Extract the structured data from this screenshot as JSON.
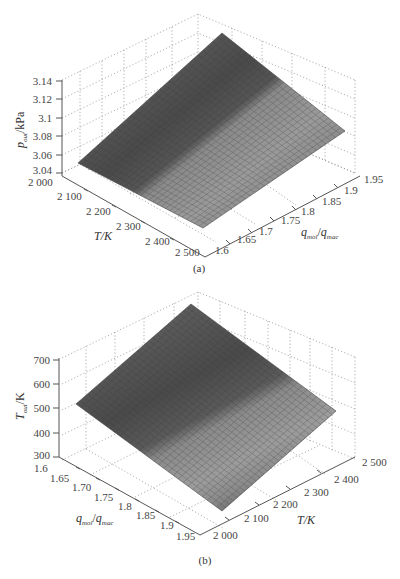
{
  "chart_data": [
    {
      "id": "a",
      "type": "surface3d",
      "caption": "(a)",
      "zlabel": "p_out/kPa",
      "zlabel_main": "p",
      "zlabel_sub": "out",
      "zlabel_unit": "/kPa",
      "xlabel": "T/K",
      "ylabel": "q_mol/q_mac",
      "zlim": [
        3.04,
        3.14
      ],
      "xlim": [
        2000,
        2500
      ],
      "ylim": [
        1.6,
        1.95
      ],
      "zticks": [
        "3.04",
        "3.06",
        "3.08",
        "3.1",
        "3.12",
        "3.14"
      ],
      "xticks": [
        "2 000",
        "2 100",
        "2 200",
        "2 300",
        "2 400",
        "2 500"
      ],
      "yticks": [
        "1.6",
        "1.65",
        "1.7",
        "1.75",
        "1.8",
        "1.85",
        "1.9",
        "1.95"
      ],
      "grid": true,
      "colormap": "gray",
      "surface_corners": {
        "T2000_q1.95": 3.1,
        "T2000_q1.6": 3.14,
        "T2500_q1.95": 3.05,
        "T2500_q1.6": 3.08
      }
    },
    {
      "id": "b",
      "type": "surface3d",
      "caption": "(b)",
      "zlabel": "T_out/K",
      "zlabel_main": "T",
      "zlabel_sub": "out",
      "zlabel_unit": "/K",
      "xlabel": "q_mol/q_mac",
      "ylabel": "T/K",
      "zlim": [
        300,
        700
      ],
      "xlim": [
        1.6,
        1.95
      ],
      "ylim": [
        2000,
        2500
      ],
      "zticks": [
        "300",
        "400",
        "500",
        "600",
        "700"
      ],
      "xticks": [
        "1.6",
        "1.65",
        "1.70",
        "1.75",
        "1.8",
        "1.85",
        "1.9",
        "1.95"
      ],
      "yticks": [
        "2 000",
        "2 100",
        "2 200",
        "2 300",
        "2 400",
        "2 500"
      ],
      "grid": true,
      "colormap": "gray",
      "surface_corners": {
        "q1.6_T2500": 720,
        "q1.6_T2000": 510,
        "q1.95_T2500": 470,
        "q1.95_T2000": 320
      }
    }
  ],
  "labels": {
    "a": {
      "z_main": "p",
      "z_sub": "out",
      "z_unit": "/kPa",
      "x_label": "T/K",
      "y_main": "q",
      "y_sub1": "mol",
      "y_sep": "/",
      "y_main2": "q",
      "y_sub2": "mac",
      "caption": "(a)"
    },
    "b": {
      "z_main": "T",
      "z_sub": "out",
      "z_unit": "/K",
      "x_main": "q",
      "x_sub1": "mol",
      "x_sep": "/",
      "x_main2": "q",
      "x_sub2": "mac",
      "y_label": "T/K",
      "caption": "(b)"
    }
  },
  "ticks": {
    "a_z": [
      "3.14",
      "3.12",
      "3.1",
      "3.08",
      "3.06",
      "3.04"
    ],
    "a_x": [
      "2 000",
      "2 100",
      "2 200",
      "2 300",
      "2 400",
      "2 500"
    ],
    "a_y": [
      "1.6",
      "1.65",
      "1.7",
      "1.75",
      "1.8",
      "1.85",
      "1.9",
      "1.95"
    ],
    "b_z": [
      "700",
      "600",
      "500",
      "400",
      "300"
    ],
    "b_x": [
      "1.6",
      "1.65",
      "1.70",
      "1.75",
      "1.8",
      "1.85",
      "1.9",
      "1.95"
    ],
    "b_y": [
      "2 000",
      "2 100",
      "2 200",
      "2 300",
      "2 400",
      "2 500"
    ]
  }
}
